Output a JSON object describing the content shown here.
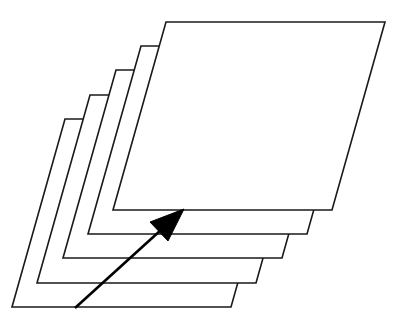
{
  "diagram": {
    "sheet_count": 5,
    "sheet": {
      "width": 219,
      "height": 188,
      "skew_x": 53
    },
    "sheets": [
      {
        "id": "sheet-1",
        "bottom_left": [
          12,
          307
        ]
      },
      {
        "id": "sheet-2",
        "bottom_left": [
          37,
          283
        ]
      },
      {
        "id": "sheet-3",
        "bottom_left": [
          63,
          258
        ]
      },
      {
        "id": "sheet-4",
        "bottom_left": [
          88,
          234
        ]
      },
      {
        "id": "sheet-5",
        "bottom_left": [
          113,
          210
        ]
      }
    ],
    "arrow": {
      "from": [
        75,
        308
      ],
      "to": [
        184,
        209
      ],
      "head": [
        [
          184,
          209
        ],
        [
          150,
          222
        ],
        [
          168,
          241
        ]
      ]
    },
    "colors": {
      "stroke": "#1a1a1a",
      "fill": "#ffffff",
      "arrow": "#000000",
      "background": "#ffffff"
    }
  }
}
